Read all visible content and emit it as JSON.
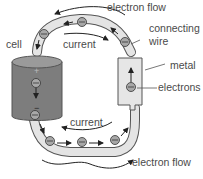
{
  "diagram": {
    "labels": {
      "electron_flow_top": "electron flow",
      "electron_flow_bottom": "electron flow",
      "current_top": "current",
      "current_bottom": "current",
      "cell": "cell",
      "connecting": "connecting",
      "wire": "wire",
      "metal": "metal",
      "electrons": "electrons",
      "plus": "+",
      "minus": "−"
    },
    "colors": {
      "cell_fill": "#7d7d7d",
      "cell_top": "#9a9a9a",
      "wire_fill": "#e4e4e4",
      "metal_fill": "#e6e6e6",
      "electron_fill": "#a8a8a8",
      "outline": "#555555",
      "arrow": "#222222"
    }
  }
}
